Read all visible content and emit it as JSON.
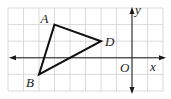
{
  "figure": {
    "grid": {
      "xmin": -8,
      "xmax": 2,
      "ymin": -2,
      "ymax": 3
    },
    "axes": {
      "x_label": "x",
      "y_label": "y",
      "origin_label": "O"
    },
    "points": [
      {
        "label": "A",
        "x": -5,
        "y": 2
      },
      {
        "label": "D",
        "x": -2,
        "y": 1
      },
      {
        "label": "B",
        "x": -6,
        "y": -1
      }
    ],
    "polygon": [
      "A",
      "D",
      "B"
    ],
    "colors": {
      "grid": "#d0d0d0",
      "axes": "#1a1a1a",
      "triangle": "#111111"
    }
  }
}
